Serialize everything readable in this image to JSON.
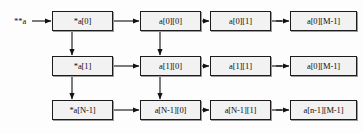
{
  "diagram": {
    "entry_label": "**a",
    "geometry": {
      "width": 363,
      "height": 133,
      "box_width": 61,
      "box_height": 20,
      "column_x": [
        52,
        140,
        210,
        290
      ],
      "row_y": [
        11,
        56,
        100
      ],
      "last_column_width": 67
    },
    "colors": {
      "background": "#fdfdfd",
      "box_fill": "#f2f2f2",
      "box_border": "#1c1c1c",
      "box_shadow": "#9a9a9a",
      "arrow": "#111111",
      "text": "#0d0d0d"
    },
    "rows": [
      {
        "name": "row-0",
        "cells": [
          {
            "label": "*a[0]"
          },
          {
            "label": "a[0][0]"
          },
          {
            "label": "a[0][1]"
          },
          {
            "label": "a[0][M-1]"
          }
        ]
      },
      {
        "name": "row-1",
        "cells": [
          {
            "label": "*a[1]"
          },
          {
            "label": "a[1][0]"
          },
          {
            "label": "a[1][1]"
          },
          {
            "label": "a[0][M-1]"
          }
        ]
      },
      {
        "name": "row-n",
        "cells": [
          {
            "label": "*a[N-1]"
          },
          {
            "label": "a[N-1][0]"
          },
          {
            "label": "a[N-1][1]"
          },
          {
            "label": "a[n-1][M-1]"
          }
        ]
      }
    ],
    "connectors": {
      "entry_arrow": "solid-arrow",
      "horizontal_arrow": "solid-arrow",
      "vertical_arrow": "solid-arrow",
      "ellipsis_arrow": "dashed-arrow",
      "vertical_columns": [
        0,
        1
      ]
    }
  }
}
